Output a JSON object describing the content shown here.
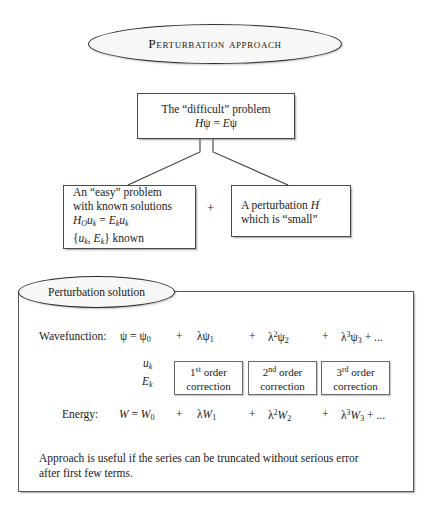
{
  "title": {
    "label": "Perturbation approach"
  },
  "problem_box": {
    "line1": "The “difficult” problem",
    "line2_h": "H",
    "line2_psi": "ψ",
    "line2_eq": " = ",
    "line2_e": "E",
    "line2_psi2": "ψ"
  },
  "easy_box": {
    "line1": "An “easy” problem",
    "line2": "with known solutions",
    "line3": {
      "h": "H",
      "h_sub": "O",
      "u": "u",
      "u_sub": "k",
      "eq": " = ",
      "e": "E",
      "e_sub": "k",
      "u2": "u",
      "u2_sub": "k"
    },
    "line4": {
      "open": "{",
      "u": "u",
      "u_sub": "k",
      "comma": ", ",
      "e": "E",
      "e_sub": "k",
      "close": "}",
      "known": " known"
    }
  },
  "operator_plus": "+",
  "perturbation_box": {
    "line1_pre": "A perturbation ",
    "line1_h": "H",
    "line1_prime": "′",
    "line2": "which is “small”"
  },
  "solution": {
    "ellipse_label": "Perturbation solution",
    "wavefunction": {
      "label": "Wavefunction:",
      "lhs_psi": "ψ",
      "eq": " = ",
      "term0": {
        "sym": "ψ",
        "sub": "0"
      },
      "terms": [
        {
          "plus": "+",
          "lam": "λ",
          "pow": "",
          "sym": "ψ",
          "sub": "1"
        },
        {
          "plus": "+",
          "lam": "λ",
          "pow": "2",
          "sym": "ψ",
          "sub": "2"
        },
        {
          "plus": "+",
          "lam": "λ",
          "pow": "3",
          "sym": "ψ",
          "sub": "3",
          "tail": " + ..."
        }
      ],
      "zeroth_target": {
        "sym": "u",
        "sub": "k"
      }
    },
    "energy": {
      "label": "Energy:",
      "lhs_w": "W",
      "eq": " = ",
      "term0": {
        "sym": "W",
        "sub": "0"
      },
      "terms": [
        {
          "plus": "+",
          "lam": "λ",
          "pow": "",
          "sym": "W",
          "sub": "1"
        },
        {
          "plus": "+",
          "lam": "λ",
          "pow": "2",
          "sym": "W",
          "sub": "2"
        },
        {
          "plus": "+",
          "lam": "λ",
          "pow": "3",
          "sym": "W",
          "sub": "3",
          "tail": " + ..."
        }
      ],
      "zeroth_target": {
        "sym": "E",
        "sub": "k"
      }
    },
    "corrections": [
      {
        "ordinal": "1",
        "suffix": "st",
        "word": " order",
        "line2": "correction"
      },
      {
        "ordinal": "2",
        "suffix": "nd",
        "word": " order",
        "line2": "correction"
      },
      {
        "ordinal": "3",
        "suffix": "rd",
        "word": " order",
        "line2": "correction"
      }
    ],
    "footnote_line1": "Approach is useful if the series can be truncated without serious error",
    "footnote_line2": "after first few terms."
  },
  "colors": {
    "ink": "#1a1a1a",
    "rule": "#4a4a4a",
    "ellipse_fill": "#f7f7f5"
  }
}
